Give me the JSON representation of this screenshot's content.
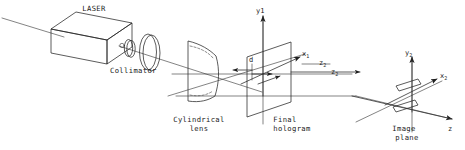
{
  "figure": {
    "background_color": "#ffffff",
    "line_color": "#262626",
    "text_color": "#1a1a1a",
    "width": 465,
    "height": 150
  },
  "components": [
    {
      "id": "laser",
      "label": "LASER",
      "name": "laser-source"
    },
    {
      "id": "collimator",
      "label": "Collimator",
      "name": "collimator-assembly"
    },
    {
      "id": "cylindrical_lens",
      "label": "Cylindrical\nlens",
      "name": "cylindrical-lens",
      "line1": "Cylindrical",
      "line2": "lens"
    },
    {
      "id": "final_hologram",
      "label": "Final\nhologram",
      "name": "final-hologram-plane",
      "line1": "Final",
      "line2": "hologram"
    },
    {
      "id": "image_plane",
      "label": "Image\nplane",
      "name": "image-plane",
      "line1": "Image",
      "line2": "plane"
    }
  ],
  "axes": [
    {
      "id": "y1",
      "base": "y",
      "sub": "1",
      "name": "axis-label-y1"
    },
    {
      "id": "x1",
      "base": "x",
      "sub": "1",
      "name": "axis-label-x1"
    },
    {
      "id": "z2_left",
      "base": "z",
      "sub": "2",
      "name": "axis-label-z2-left"
    },
    {
      "id": "z2_right",
      "base": "z",
      "sub": "2",
      "name": "axis-label-z2-right"
    },
    {
      "id": "y2",
      "base": "y",
      "sub": "2",
      "name": "axis-label-y2"
    },
    {
      "id": "x2",
      "base": "x",
      "sub": "2",
      "name": "axis-label-x2"
    },
    {
      "id": "z",
      "base": "z",
      "sub": "",
      "name": "axis-label-z"
    }
  ],
  "dimensions": [
    {
      "id": "d",
      "label": "d",
      "name": "dimension-label-d",
      "description": "separation between cylindrical lens and final hologram"
    }
  ]
}
